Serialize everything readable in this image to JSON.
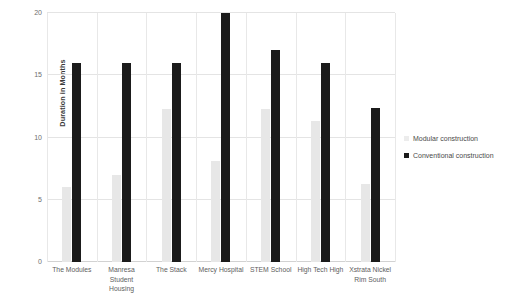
{
  "chart_data": {
    "type": "bar",
    "title": "",
    "xlabel": "",
    "ylabel": "Duration in Months",
    "ylim": [
      0,
      20
    ],
    "yticks": [
      0,
      5,
      10,
      15,
      20
    ],
    "ytick_labels": [
      "0",
      "5",
      "10",
      "15",
      "20"
    ],
    "grid": true,
    "legend_position": "right",
    "categories": [
      "The Modules",
      "Manresa Student Housing",
      "The Stack",
      "Mercy Hospital",
      "STEM School",
      "High Tech High",
      "Xstrata Nickel Rim South"
    ],
    "series": [
      {
        "name": "Modular construction",
        "color": "#e7e7e7",
        "values": [
          6.0,
          7.0,
          12.3,
          8.1,
          12.3,
          11.3,
          6.3
        ]
      },
      {
        "name": "Conventional construction",
        "color": "#1b1b1b",
        "values": [
          16.0,
          16.0,
          16.0,
          20.0,
          17.0,
          16.0,
          12.4
        ]
      }
    ]
  },
  "legend": {
    "items": [
      {
        "label": "Modular construction",
        "swatch": "modular"
      },
      {
        "label": "Conventional construction",
        "swatch": "conventional"
      }
    ]
  }
}
